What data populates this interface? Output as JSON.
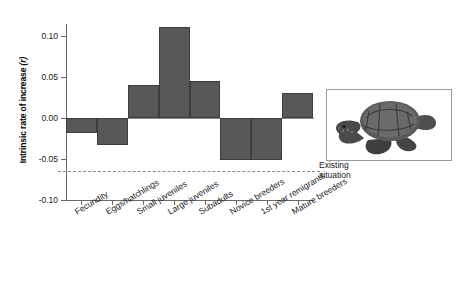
{
  "figure": {
    "inset_caption": "loggerhead-sea-turtle-photo"
  },
  "chart_data": {
    "type": "bar",
    "title": "",
    "xlabel": "",
    "ylabel": "Intrinsic rate of increase (r)",
    "ylabel_plain": "Intrinsic rate of increase",
    "ylabel_italic": "(r)",
    "categories": [
      "Fecundity",
      "Eggs/hatchlings",
      "Small juveniles",
      "Large juveniles",
      "Subadults",
      "Novice breeders",
      "1st year remigrants",
      "Mature breeders"
    ],
    "values": [
      -0.018,
      -0.033,
      0.04,
      0.111,
      0.045,
      -0.051,
      -0.051,
      0.031
    ],
    "ylim": [
      -0.1,
      0.115
    ],
    "yticks": [
      0.1,
      0.05,
      0.0,
      -0.05,
      -0.1
    ],
    "ytick_labels": [
      "0.10",
      "0.05",
      "0.00",
      "-0.05",
      "-0.10"
    ],
    "grid": false,
    "legend": "none",
    "bar_color": "#58585a",
    "annotations": [
      {
        "name": "existing-situation",
        "type": "hline",
        "value": -0.065,
        "style": "dashed",
        "color": "#8a8a8a",
        "label_line1": "Existing",
        "label_line2": "situation"
      }
    ]
  }
}
